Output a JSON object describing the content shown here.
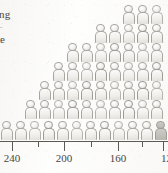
{
  "caption": {
    "fragment_1": "ng",
    "fragment_2": "-",
    "fragment_3": "e"
  },
  "axis": {
    "labels": [
      "240",
      "200",
      "160",
      "12"
    ],
    "label_positions_px": [
      12,
      64,
      118,
      163
    ],
    "major_tick_positions_px": [
      12,
      64,
      118,
      163
    ],
    "minor_tick_positions_px": [
      38,
      91,
      142
    ],
    "direction": "descending-left-to-right",
    "axis_color": "#5d5a56"
  },
  "colors": {
    "paper": "#fdfdfc",
    "glyph_fill": "#f1f0ed",
    "glyph_outline": "#a9a6a0",
    "ink": "#33312e"
  },
  "chart_data": {
    "type": "bar",
    "subtype": "pictogram",
    "title": "",
    "xlabel": "",
    "ylabel": "",
    "unit_note": "each icon represents one unit (person)",
    "categories": [
      "240",
      "230",
      "220",
      "210",
      "200",
      "190",
      "180",
      "170",
      "160",
      "150",
      "140",
      "130"
    ],
    "x": [
      240,
      230,
      220,
      210,
      200,
      190,
      180,
      170,
      160,
      150,
      140,
      130
    ],
    "values": [
      1,
      2,
      2,
      3,
      4,
      4,
      5,
      5,
      6,
      6,
      7,
      7
    ],
    "xlim": [
      250,
      120
    ],
    "ylim": [
      0,
      8
    ],
    "grid": false,
    "legend": null,
    "rows": [
      {
        "row_index": 0,
        "y_px": 4,
        "start_px": 122,
        "count": 3
      },
      {
        "row_index": 1,
        "y_px": 23,
        "start_px": 94,
        "count": 5
      },
      {
        "row_index": 2,
        "y_px": 42,
        "start_px": 66,
        "count": 7
      },
      {
        "row_index": 3,
        "y_px": 61,
        "start_px": 52,
        "count": 8
      },
      {
        "row_index": 4,
        "y_px": 80,
        "start_px": 38,
        "count": 9
      },
      {
        "row_index": 5,
        "y_px": 99,
        "start_px": 24,
        "count": 10
      },
      {
        "row_index": 6,
        "y_px": 120,
        "start_px": 0,
        "count": 12
      }
    ]
  }
}
